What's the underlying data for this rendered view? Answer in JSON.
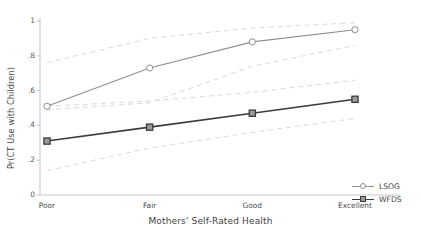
{
  "chart_data": {
    "type": "line",
    "title": "",
    "xlabel": "Mothers' Self-Rated Health",
    "ylabel": "Pr(CT Use with Children)",
    "categories": [
      "Poor",
      "Fair",
      "Good",
      "Excellent"
    ],
    "x": [
      1,
      2,
      3,
      4
    ],
    "ylim": [
      0,
      1
    ],
    "yticks": [
      0,
      0.2,
      0.4,
      0.6,
      0.8,
      1
    ],
    "ytick_labels": [
      "0",
      ".2",
      ".4",
      ".6",
      ".8",
      "1"
    ],
    "grid": false,
    "legend_position": "right-bottom",
    "series": [
      {
        "name": "LSOG",
        "values": [
          0.51,
          0.73,
          0.88,
          0.95
        ],
        "marker": "circle",
        "color": "#8f8f8f",
        "ci_upper": [
          0.76,
          0.9,
          0.96,
          0.99
        ],
        "ci_lower": [
          0.49,
          0.53,
          0.74,
          0.86
        ]
      },
      {
        "name": "WFDS",
        "values": [
          0.31,
          0.39,
          0.47,
          0.55
        ],
        "marker": "square",
        "color": "#3b3b3b",
        "ci_upper": [
          0.51,
          0.54,
          0.59,
          0.66
        ],
        "ci_lower": [
          0.14,
          0.27,
          0.36,
          0.44
        ]
      }
    ],
    "annotations": []
  },
  "legend": {
    "items": [
      {
        "label": "LSOG"
      },
      {
        "label": "WFDS"
      }
    ]
  },
  "colors": {
    "axis": "#c9c9c9",
    "ci_band": "#d9d9d9",
    "lsog": "#8f8f8f",
    "wfds": "#3b3b3b",
    "text": "#3f3f3f",
    "background": "#ffffff"
  }
}
